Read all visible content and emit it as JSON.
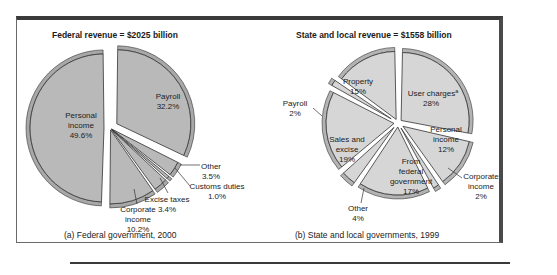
{
  "chart_data": [
    {
      "type": "pie",
      "title": "Federal revenue = $2025 billion",
      "caption": "(a) Federal government, 2000",
      "total_billion": 2025,
      "unit": "percent",
      "slices": [
        {
          "label": "Payroll",
          "value": 32.2,
          "display": "32.2%",
          "exploded": true
        },
        {
          "label": "Other",
          "value": 3.5,
          "display": "3.5%",
          "exploded": false
        },
        {
          "label": "Customs duties",
          "value": 1.0,
          "display": "1.0%",
          "exploded": false
        },
        {
          "label": "Excise taxes",
          "value": 3.4,
          "display": "3.4%",
          "exploded": false
        },
        {
          "label": "Corporate income",
          "value": 10.2,
          "display": "10.2%",
          "exploded": false
        },
        {
          "label": "Personal income",
          "value": 49.6,
          "display": "49.6%",
          "exploded": true
        }
      ]
    },
    {
      "type": "pie",
      "title": "State and local revenue = $1558 billion",
      "caption": "(b) State and local governments, 1999",
      "total_billion": 1558,
      "unit": "percent",
      "slices": [
        {
          "label": "User charges",
          "superscript": "a",
          "value": 28,
          "display": "28%",
          "exploded": true
        },
        {
          "label": "Personal income",
          "value": 12,
          "display": "12%",
          "exploded": true
        },
        {
          "label": "Corporate income",
          "value": 2,
          "display": "2%",
          "exploded": true
        },
        {
          "label": "From federal government",
          "value": 17,
          "display": "17%",
          "exploded": true
        },
        {
          "label": "Other",
          "value": 4,
          "display": "4%",
          "exploded": true
        },
        {
          "label": "Sales and excise",
          "value": 19,
          "display": "19%",
          "exploded": true
        },
        {
          "label": "Payroll",
          "value": 2,
          "display": "2%",
          "exploded": true
        },
        {
          "label": "Property",
          "value": 15,
          "display": "15%",
          "exploded": true
        }
      ]
    }
  ],
  "labels": {
    "fed": {
      "payroll": [
        "Payroll",
        "32.2%"
      ],
      "other": [
        "Other",
        "3.5%"
      ],
      "customs": [
        "Customs duties",
        "1.0%"
      ],
      "excise": [
        "Excise taxes",
        "3.4%"
      ],
      "corporate": [
        "Corporate",
        "income",
        "10.2%"
      ],
      "personal": [
        "Personal",
        "income",
        "49.6%"
      ]
    },
    "state": {
      "user": [
        "User charges",
        "a",
        "28%"
      ],
      "personal": [
        "Personal",
        "income",
        "12%"
      ],
      "corporate": [
        "Corporate",
        "income",
        "2%"
      ],
      "federal": [
        "From",
        "federal",
        "government",
        "17%"
      ],
      "other": [
        "Other",
        "4%"
      ],
      "sales": [
        "Sales and",
        "excise",
        "19%"
      ],
      "payroll": [
        "Payroll",
        "2%"
      ],
      "property": [
        "Property",
        "15%"
      ]
    }
  }
}
